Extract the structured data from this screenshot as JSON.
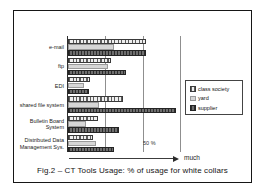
{
  "figure": {
    "caption": "Fig.2 – CT Tools Usage: % of usage for white collars"
  },
  "chart_data": {
    "type": "bar",
    "orientation": "horizontal",
    "title": "Fig.2 – CT Tools Usage: % of usage for white collars",
    "categories": [
      "e-mail",
      "ftp",
      "EDI",
      "shared file system",
      "Bulletin Board System",
      "Distributed Data Management Sys."
    ],
    "series": [
      {
        "name": "class society",
        "style": "s0",
        "values": [
          52,
          29,
          15,
          37,
          20,
          17
        ]
      },
      {
        "name": "yard",
        "style": "s1",
        "values": [
          31,
          27,
          11,
          21,
          12,
          19
        ]
      },
      {
        "name": "supplier",
        "style": "s2",
        "values": [
          52,
          39,
          14,
          72,
          34,
          31
        ]
      }
    ],
    "xlim": [
      0,
      75
    ],
    "gridlines_pct": [
      25,
      50,
      75
    ],
    "tick_label": "50 %",
    "axis_arrow_label": "much",
    "legend_position": "right",
    "grid": true,
    "colors": {
      "class_society_fill": "#efefef",
      "class_society_hatch": "#5d5d5d",
      "yard_fill": "#d6d6d6",
      "supplier_fill": "#6e6e6e",
      "supplier_hatch": "#2d2d2d",
      "frame_border": "#161616",
      "background": "#ffffff"
    }
  },
  "legend": {
    "items": [
      {
        "label": "class society"
      },
      {
        "label": "yard"
      },
      {
        "label": "supplier"
      }
    ]
  },
  "annotations": {
    "fifty_pct": "50 %",
    "much": "much"
  }
}
